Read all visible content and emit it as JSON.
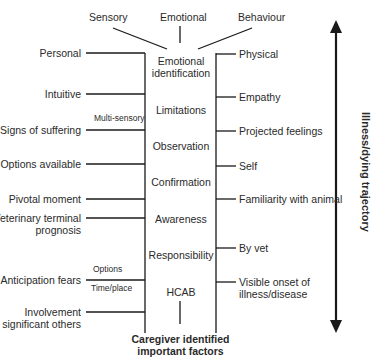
{
  "top_categories": [
    "Sensory",
    "Emotional",
    "Behaviour"
  ],
  "center_column": [
    "Emotional identification",
    "Limitations",
    "Observation",
    "Confirmation",
    "Awareness",
    "Responsibility",
    "HCAB"
  ],
  "center_lines": {
    "emotional_1": "Emotional",
    "emotional_2": "identification"
  },
  "left_factors": [
    "Personal",
    "Intuitive",
    "Signs of suffering",
    "Options available",
    "Pivotal moment",
    "Veterinary terminal",
    "prognosis",
    "Anticipation fears",
    "Involvement",
    "of significant others"
  ],
  "left_annotations": {
    "multi_sensory": "Multi-sensory",
    "options": "Options",
    "time_place": "Time/place"
  },
  "right_factors": [
    "Physical",
    "Empathy",
    "Projected feelings",
    "Self",
    "Familiarity with animal",
    "By vet",
    "Visible onset of",
    "illness/disease"
  ],
  "footer": {
    "line1": "Caregiver identified",
    "line2": "important factors"
  },
  "trajectory_label": "Illness/dying trajectory"
}
